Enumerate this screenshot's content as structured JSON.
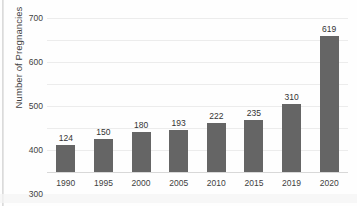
{
  "chart_data": {
    "type": "bar",
    "title": "",
    "subtitle": "",
    "xlabel": "",
    "ylabel": "Number of Pregnancies",
    "categories": [
      "1990",
      "1995",
      "2000",
      "2005",
      "2010",
      "2015",
      "2019",
      "2020"
    ],
    "values": [
      124,
      150,
      180,
      193,
      222,
      235,
      310,
      619
    ],
    "data_labels": [
      "124",
      "150",
      "180",
      "193",
      "222",
      "235",
      "310",
      "619"
    ],
    "ylim": [
      0,
      700
    ],
    "ytick_labels": [
      "700",
      "600",
      "500",
      "400",
      "300",
      "200",
      "100",
      "0"
    ],
    "ytick_values": [
      700,
      600,
      500,
      400,
      300,
      200,
      100,
      0
    ],
    "grid": "horizontal",
    "legend": "none",
    "bar_color": "#656565",
    "gridline_color": "#ececec",
    "axis_color": "#d8d8d8",
    "text_color": "#3f3f3f",
    "background_color": "#fefefe"
  }
}
